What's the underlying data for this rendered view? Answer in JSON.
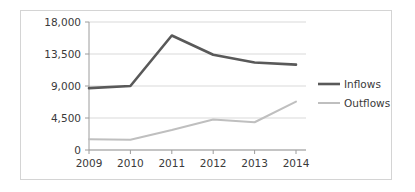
{
  "chart_data": {
    "type": "line",
    "title": "",
    "xlabel": "",
    "ylabel": "",
    "categories": [
      "2009",
      "2010",
      "2011",
      "2012",
      "2013",
      "2014"
    ],
    "x": [
      2009,
      2010,
      2011,
      2012,
      2013,
      2014
    ],
    "series": [
      {
        "name": "Inflows",
        "values": [
          8700,
          9000,
          16100,
          13400,
          12300,
          12000
        ],
        "color": "#595959",
        "line_width": 2.6
      },
      {
        "name": "Outflows",
        "values": [
          1500,
          1450,
          2800,
          4300,
          3900,
          6800
        ],
        "color": "#bfbfbf",
        "line_width": 2.0
      }
    ],
    "ylim": [
      0,
      18000
    ],
    "yticks": [
      0,
      4500,
      9000,
      13500,
      18000
    ],
    "ytick_labels": [
      "0",
      "4,500",
      "9,000",
      "13,500",
      "18,000"
    ],
    "xtick_labels": [
      "2009",
      "2010",
      "2011",
      "2012",
      "2013",
      "2014"
    ],
    "grid": true,
    "grid_axis": "y",
    "grid_color": "#d9d9d9",
    "legend_position": "right",
    "legend_entries": [
      "Inflows",
      "Outflows"
    ],
    "axis_color": "#9c9c9c",
    "border_color": "#d4d4d4",
    "background": "#ffffff"
  }
}
